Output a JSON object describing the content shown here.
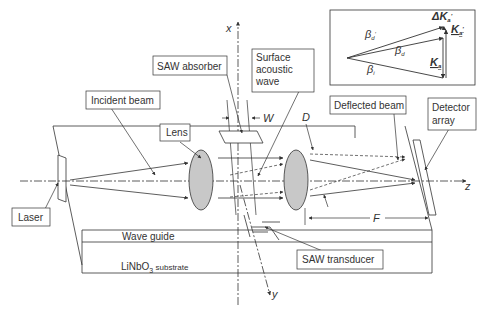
{
  "labels": {
    "saw_absorber": "SAW absorber",
    "surface_acoustic_wave": [
      "Surface",
      "acoustic",
      "wave"
    ],
    "incident_beam": "Incident beam",
    "lens": "Lens",
    "deflected_beam": "Deflected beam",
    "detector_array": [
      "Detector",
      "array"
    ],
    "laser": "Laser",
    "wave_guide": "Wave guide",
    "substrate_main": "LiNbO",
    "substrate_sub": "3",
    "substrate_rest": " substrate",
    "saw_transducer": "SAW transducer"
  },
  "axes": {
    "x": "x",
    "y": "y",
    "z": "z"
  },
  "dimensions": {
    "W": "W",
    "D": "D",
    "F": "F"
  },
  "inset": {
    "beta_d_prime": "β",
    "beta_d_prime_sub": "d",
    "beta_d": "β",
    "beta_d_sub": "d",
    "beta_i": "β",
    "beta_i_sub": "i",
    "delta_K": "ΔK",
    "delta_K_sub": "a",
    "K_prime": "K",
    "K_prime_sub": "a",
    "K": "K",
    "K_sub": "a"
  }
}
